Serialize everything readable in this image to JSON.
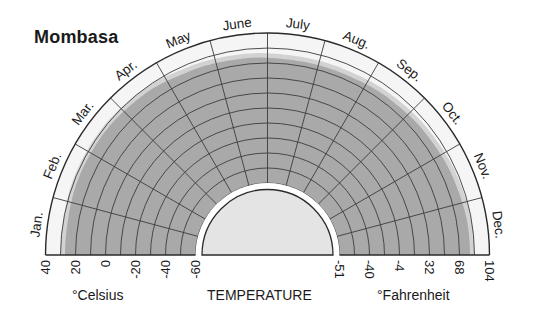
{
  "title": "Mombasa",
  "axis": {
    "label": "TEMPERATURE",
    "celsius_unit": "°Celsius",
    "fahrenheit_unit": "°Fahrenheit",
    "celsius_ticks": [
      "40",
      "20",
      "0",
      "-20",
      "-40",
      "-60"
    ],
    "fahrenheit_ticks": [
      "-51",
      "-40",
      "-4",
      "32",
      "68",
      "104"
    ]
  },
  "months": [
    "Jan.",
    "Feb.",
    "Mar.",
    "Apr.",
    "May",
    "June",
    "July",
    "Aug.",
    "Sep.",
    "Oct.",
    "Nov.",
    "Dec."
  ],
  "colors": {
    "outline": "#2a2a2a",
    "grid": "#3c3c3c",
    "band_light": "#d2d2d2",
    "band_dark": "#a9a9a9",
    "outer_ring": "#f5f5f5",
    "center_fill": "#e4e4e4"
  },
  "chart_data": {
    "type": "radial-area",
    "title": "Mombasa",
    "xlabel": "Month",
    "ylabel": "TEMPERATURE",
    "categories": [
      "Jan.",
      "Feb.",
      "Mar.",
      "Apr.",
      "May",
      "June",
      "July",
      "Aug.",
      "Sep.",
      "Oct.",
      "Nov.",
      "Dec."
    ],
    "series": [
      {
        "name": "Mean daily maximum (°C)",
        "values": [
          30,
          31,
          31,
          30,
          28,
          27,
          26,
          26,
          27,
          28,
          29,
          30
        ]
      },
      {
        "name": "Mean daily minimum (°C)",
        "values": [
          27,
          28,
          28,
          27,
          25,
          24,
          23,
          23,
          24,
          25,
          26,
          27
        ]
      }
    ],
    "radial_scale_celsius": [
      -60,
      40
    ],
    "ring_interval_celsius": 10,
    "celsius_tick_labels": [
      40,
      20,
      0,
      -20,
      -40,
      -60
    ],
    "fahrenheit_tick_labels": [
      -51,
      -40,
      -4,
      32,
      68,
      104
    ],
    "grid": true
  }
}
